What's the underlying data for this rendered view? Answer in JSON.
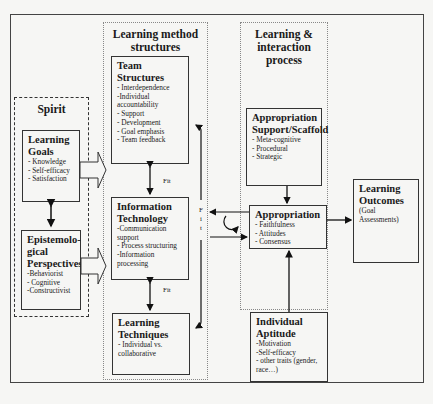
{
  "sections": {
    "spirit": "Spirit",
    "lms": [
      "Learning method",
      "structures"
    ],
    "lip": [
      "Learning &",
      "interaction",
      "process"
    ]
  },
  "boxes": {
    "learning_goals": {
      "title": [
        "Learning",
        "Goals"
      ],
      "items": [
        "- Knowledge",
        "- Self-efficacy",
        "- Satisfaction"
      ]
    },
    "epistemological": {
      "title": [
        "Epistemolo-",
        "gical",
        "Perspectives"
      ],
      "items": [
        "-Behaviorist",
        "- Cognitive",
        "-Constructivist"
      ]
    },
    "team_structures": {
      "title": [
        "Team",
        "Structures"
      ],
      "items": [
        "- Interdependence",
        "-Individual",
        "accountability",
        "- Support",
        "- Development",
        "- Goal emphasis",
        "- Team feedback"
      ]
    },
    "info_tech": {
      "title": [
        "Information",
        "Technology"
      ],
      "items": [
        "-Communication",
        "support",
        "- Process structuring",
        "-Information",
        "processing"
      ]
    },
    "learning_techniques": {
      "title": [
        "Learning",
        "Techniques"
      ],
      "items": [
        " - Individual vs.",
        "collaborative"
      ]
    },
    "appropriation_support": {
      "title": [
        "Appropriation",
        "Support/Scaffold"
      ],
      "items": [
        "- Meta-cognitive",
        "- Procedural",
        "- Strategic"
      ]
    },
    "appropriation": {
      "title": [
        "Appropriation"
      ],
      "items": [
        "- Faithfulness",
        "- Attitudes",
        "- Consensus"
      ]
    },
    "individual_aptitude": {
      "title": [
        "Individual",
        "Aptitude"
      ],
      "items": [
        "-Motivation",
        "-Self-efficacy",
        "- other traits (gender,",
        "race…)"
      ]
    },
    "learning_outcomes": {
      "title": [
        "Learning",
        "Outcomes"
      ],
      "items": [
        "(Goal",
        "Assessments)"
      ]
    }
  },
  "labels": {
    "fit1": "Fit",
    "fit2": "Fit",
    "fit_vertical": [
      "F",
      "i",
      "t"
    ]
  }
}
